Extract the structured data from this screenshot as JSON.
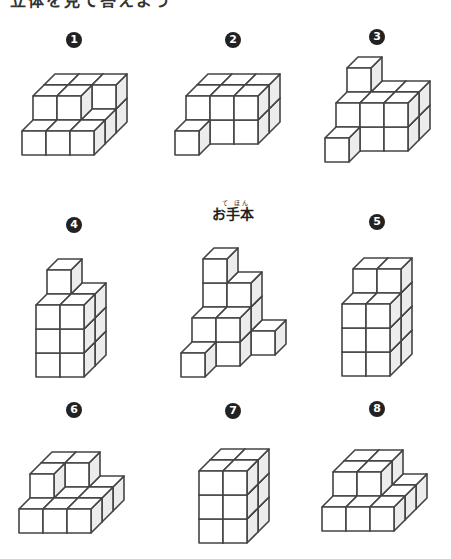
{
  "heading": "立体を見て答えよう",
  "sample": {
    "label": "お手本",
    "ruby": "て ほん"
  },
  "cube_geometry": {
    "size": 24,
    "depth_dx": 11,
    "depth_dy": 11
  },
  "figures": [
    {
      "id": "1",
      "number": "1",
      "num_pos": [
        74,
        40
      ],
      "origin": [
        22,
        155
      ],
      "heights": [
        [
          1,
          1,
          1
        ],
        [
          2,
          2,
          1
        ],
        [
          2,
          2,
          2
        ]
      ]
    },
    {
      "id": "2",
      "number": "2",
      "num_pos": [
        233,
        40
      ],
      "origin": [
        175,
        155
      ],
      "heights": [
        [
          1,
          0,
          0
        ],
        [
          2,
          2,
          2
        ],
        [
          2,
          2,
          2
        ]
      ]
    },
    {
      "id": "3",
      "number": "3",
      "num_pos": [
        377,
        37
      ],
      "origin": [
        325,
        162
      ],
      "heights": [
        [
          1,
          0,
          0
        ],
        [
          2,
          2,
          2
        ],
        [
          3,
          2,
          2
        ]
      ]
    },
    {
      "id": "4",
      "number": "4",
      "num_pos": [
        74,
        225
      ],
      "origin": [
        36,
        377
      ],
      "heights": [
        [
          3,
          3
        ],
        [
          4,
          3
        ]
      ]
    },
    {
      "id": "sample",
      "number": "",
      "num_pos": null,
      "origin": [
        181,
        377
      ],
      "heights": [
        [
          1,
          0,
          0
        ],
        [
          2,
          2,
          0
        ],
        [
          4,
          3,
          1
        ]
      ]
    },
    {
      "id": "5",
      "number": "5",
      "num_pos": [
        377,
        222
      ],
      "origin": [
        342,
        376
      ],
      "heights": [
        [
          3,
          3
        ],
        [
          4,
          4
        ]
      ]
    },
    {
      "id": "6",
      "number": "6",
      "num_pos": [
        74,
        410
      ],
      "origin": [
        19,
        533
      ],
      "heights": [
        [
          1,
          1,
          1
        ],
        [
          2,
          1,
          1
        ],
        [
          2,
          2,
          1
        ]
      ]
    },
    {
      "id": "7",
      "number": "7",
      "num_pos": [
        233,
        411
      ],
      "origin": [
        199,
        543
      ],
      "heights": [
        [
          3,
          3
        ],
        [
          3,
          3
        ]
      ]
    },
    {
      "id": "8",
      "number": "8",
      "num_pos": [
        377,
        409
      ],
      "origin": [
        322,
        531
      ],
      "heights": [
        [
          1,
          1,
          1
        ],
        [
          2,
          2,
          1
        ],
        [
          2,
          2,
          1
        ]
      ]
    }
  ],
  "colors": {
    "stroke": "#444444",
    "side": "#ececec",
    "face": "#ffffff",
    "number_bg": "#222222"
  }
}
